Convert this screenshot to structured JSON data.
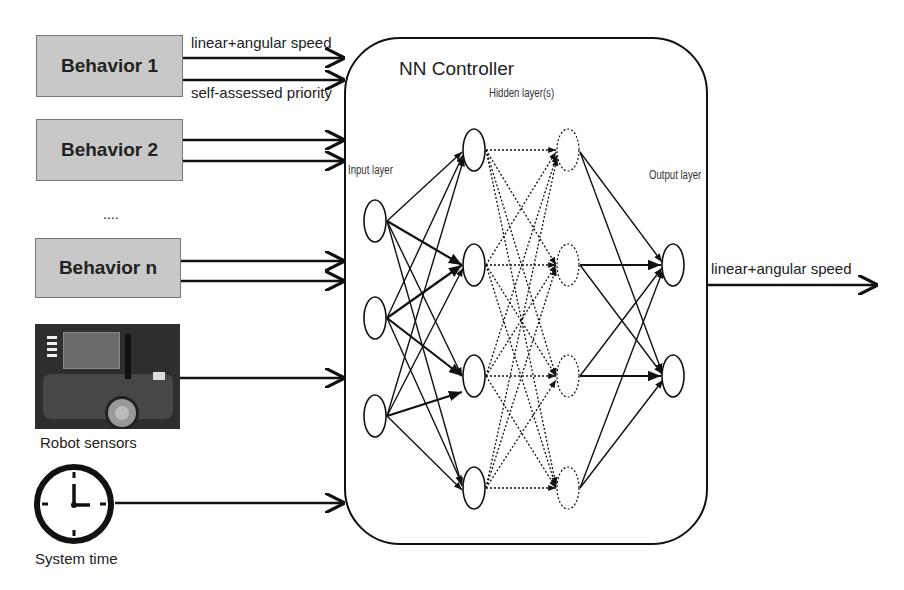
{
  "behaviors": [
    {
      "label": "Behavior 1"
    },
    {
      "label": "Behavior 2"
    },
    {
      "label": "Behavior n"
    }
  ],
  "ellipsis": "....",
  "input_labels": {
    "top": "linear+angular speed",
    "bottom": "self-assessed priority"
  },
  "sensors_label": "Robot sensors",
  "time_label": "System time",
  "controller": {
    "title": "NN Controller",
    "input_layer": "Input layer",
    "hidden_layer": "Hidden layer(s)",
    "output_layer": "Output layer"
  },
  "output_label": "linear+angular speed",
  "network": {
    "input_nodes": 3,
    "hidden_layers": 2,
    "hidden_nodes_per_layer": 4,
    "output_nodes": 2
  }
}
